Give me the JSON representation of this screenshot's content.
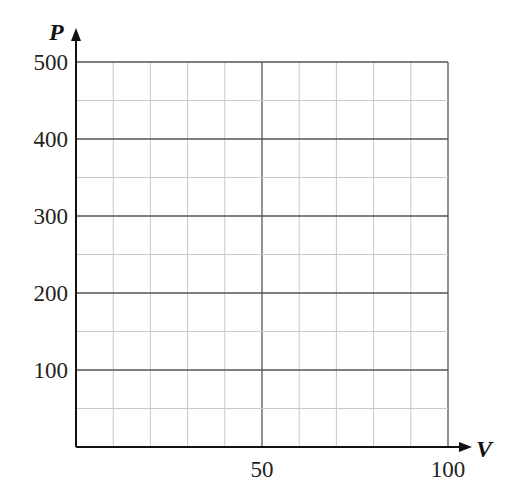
{
  "chart_data": {
    "type": "line",
    "title": "",
    "xlabel": "V",
    "ylabel": "P",
    "xlim": [
      0,
      100
    ],
    "ylim": [
      0,
      500
    ],
    "x_ticks": [
      50,
      100
    ],
    "y_ticks": [
      100,
      200,
      300,
      400,
      500
    ],
    "x_tick_labels": [
      "50",
      "100"
    ],
    "y_tick_labels": [
      "100",
      "200",
      "300",
      "400",
      "500"
    ],
    "grid": true,
    "minor_grid": {
      "x_step": 10,
      "y_step": 50
    },
    "major_grid": {
      "x_step": 50,
      "y_step": 100
    },
    "series": [],
    "legend": null
  },
  "axes": {
    "x_label": "V",
    "y_label": "P"
  },
  "colors": {
    "major_grid": "#555555",
    "minor_grid": "#c8c8c8",
    "axis": "#111111"
  }
}
